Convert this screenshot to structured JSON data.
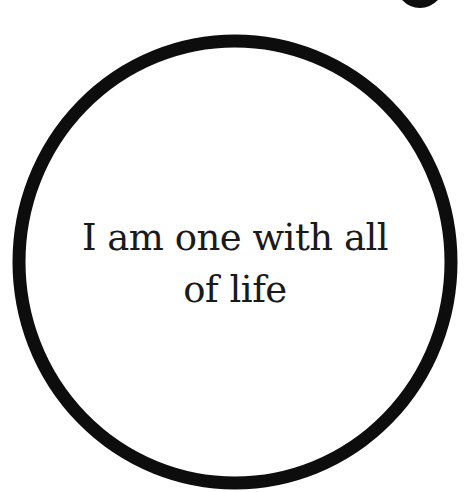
{
  "card": {
    "lines": [
      "I am one with all",
      "of life"
    ],
    "ring_color": "#0d0d0d",
    "background": "#ffffff"
  }
}
